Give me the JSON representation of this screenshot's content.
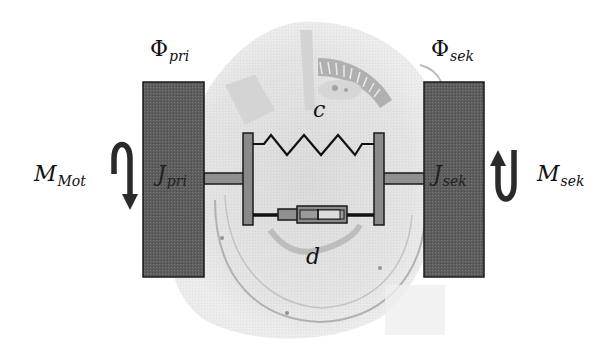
{
  "diagram": {
    "type": "two-mass torsional vibration model (dual-mass flywheel)",
    "background": "faded grayscale photo of a dual-mass flywheel",
    "colors": {
      "mass_fill": "#5e5e5e",
      "plate_fill": "#8a8a8a",
      "shaft_fill": "#8f8f8f",
      "outline": "#1a1a1a",
      "arrow": "#2a2a2a",
      "photo_tint": "#d9d9d9"
    },
    "labels": {
      "phi_pri": {
        "main": "Φ",
        "sub": "pri"
      },
      "phi_sek": {
        "main": "Φ",
        "sub": "sek"
      },
      "j_pri": {
        "main": "J",
        "sub": "pri"
      },
      "j_sek": {
        "main": "J",
        "sub": "sek"
      },
      "m_mot": {
        "main": "M",
        "sub": "Mot"
      },
      "m_sek": {
        "main": "M",
        "sub": "sek"
      },
      "spring": "c",
      "damper": "d"
    },
    "elements": {
      "primary_mass": "J_pri",
      "secondary_mass": "J_sek",
      "spring_stiffness": "c",
      "damping": "d",
      "motor_torque": "M_Mot (arrow rotating downward, left side)",
      "secondary_torque": "M_sek (arrow rotating upward, right side)"
    }
  }
}
